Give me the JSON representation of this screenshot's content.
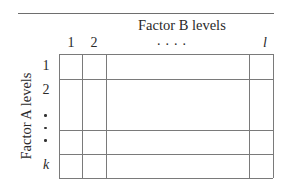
{
  "diagram": {
    "factor_b_title": "Factor B levels",
    "factor_a_title": "Factor A levels",
    "columns": {
      "labels": [
        "1",
        "2"
      ],
      "ellipsis": "....",
      "last_label": "l"
    },
    "rows": {
      "labels": [
        "1",
        "2"
      ],
      "ellipsis": "vertical dots",
      "last_label": "k"
    },
    "colors": {
      "line": "#7a7a7a",
      "text": "#2a2a2a",
      "background": "#ffffff"
    }
  }
}
